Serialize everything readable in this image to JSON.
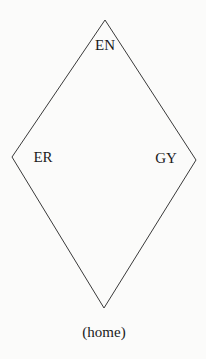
{
  "diagram": {
    "shape": "rhombus",
    "stroke_color": "#3a3a3a",
    "background": "#fbfbfa",
    "vertices": {
      "top": [
        105,
        20
      ],
      "right": [
        196,
        160
      ],
      "bottom": [
        104,
        308
      ],
      "left": [
        12,
        157
      ]
    },
    "labels": {
      "top": "EN",
      "left": "ER",
      "right": "GY",
      "bottom": "(home)"
    }
  }
}
